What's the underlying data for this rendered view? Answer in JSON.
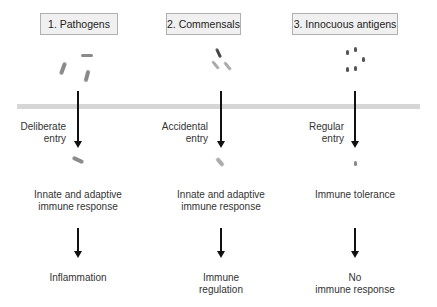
{
  "columns": [
    {
      "title": "1. Pathogens",
      "entry_label": "Deliberate\nentry",
      "entry_line1": "Deliberate",
      "entry_line2": "entry",
      "response": [
        "Innate and adaptive",
        "immune response"
      ],
      "outcome": [
        "Inflammation"
      ],
      "microbe_icon": "rod-bacteria-icon"
    },
    {
      "title": "2. Commensals",
      "entry_line1": "Accidental",
      "entry_line2": "entry",
      "response": [
        "Innate and adaptive",
        "immune response"
      ],
      "outcome": [
        "Immune",
        "regulation"
      ],
      "microbe_icon": "commensal-bacteria-icon"
    },
    {
      "title": "3. Innocuous antigens",
      "entry_line1": "Regular",
      "entry_line2": "entry",
      "response": [
        "Immune tolerance"
      ],
      "outcome": [
        "No",
        "immune response"
      ],
      "microbe_icon": "antigen-particles-icon"
    }
  ],
  "barrier": {
    "label": "",
    "color": "#d6d6d6"
  }
}
